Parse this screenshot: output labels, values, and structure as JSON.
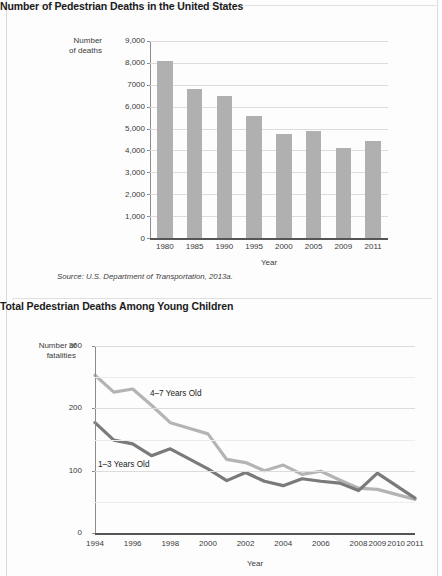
{
  "figures": {
    "bar": {
      "title": "Number of Pedestrian Deaths in the United States",
      "y_axis_title_line1": "Number",
      "y_axis_title_line2": "of deaths",
      "x_axis_title": "Year",
      "source": "Source: U.S. Department of Transportation, 2013a.",
      "y_ticks": [
        "9,000",
        "8,000",
        "7000",
        "6,000",
        "5,000",
        "4,000",
        "3,000",
        "2,000",
        "1,000",
        "0"
      ]
    },
    "line": {
      "title": "Total Pedestrian Deaths Among Young Children",
      "y_axis_title_line1": "Number of",
      "y_axis_title_line2": "fatalities",
      "x_axis_title": "Year",
      "y_ticks": [
        "300",
        "200",
        "100",
        "0"
      ],
      "label_series_1": "4–7 Years Old",
      "label_series_2": "1–3 Years Old"
    }
  },
  "chart_data": [
    {
      "type": "bar",
      "title": "Number of Pedestrian Deaths in the United States",
      "xlabel": "Year",
      "ylabel": "Number of deaths",
      "categories": [
        "1980",
        "1985",
        "1990",
        "1995",
        "2000",
        "2005",
        "2009",
        "2011"
      ],
      "values": [
        8070,
        6800,
        6480,
        5580,
        4760,
        4890,
        4090,
        4430
      ],
      "ylim": [
        0,
        9000
      ],
      "ytick_values": [
        0,
        1000,
        2000,
        3000,
        4000,
        5000,
        6000,
        7000,
        8000,
        9000
      ],
      "grid": true,
      "bar_color": "#b0b0b0",
      "source": "Source: U.S. Department of Transportation, 2013a."
    },
    {
      "type": "line",
      "title": "Total Pedestrian Deaths Among Young Children",
      "xlabel": "Year",
      "ylabel": "Number of fatalities",
      "x": [
        1994,
        1995,
        1996,
        1997,
        1998,
        1999,
        2000,
        2001,
        2002,
        2003,
        2004,
        2005,
        2006,
        2007,
        2008,
        2009,
        2010,
        2011
      ],
      "xtick_labels": [
        "1994",
        "1996",
        "1998",
        "2000",
        "2002",
        "2004",
        "2006",
        "2008",
        "2009",
        "2010",
        "2011"
      ],
      "ylim": [
        0,
        300
      ],
      "ytick_values": [
        0,
        100,
        200,
        300
      ],
      "grid": true,
      "legend": "inline-annotations",
      "series": [
        {
          "name": "4–7 Years Old",
          "color": "#b4b4b4",
          "values": [
            253,
            226,
            231,
            205,
            177,
            168,
            159,
            118,
            113,
            100,
            109,
            94,
            99,
            85,
            72,
            70,
            62,
            54
          ]
        },
        {
          "name": "1–3 Years Old",
          "color": "#7a7a7a",
          "values": [
            177,
            149,
            143,
            124,
            135,
            119,
            103,
            84,
            97,
            83,
            76,
            87,
            83,
            80,
            68,
            96,
            76,
            56
          ]
        }
      ]
    }
  ]
}
